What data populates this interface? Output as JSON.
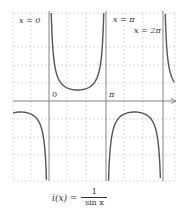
{
  "chart_data": {
    "type": "line",
    "title": "",
    "function": "i(x) = 1 / sin x",
    "xlabel": "",
    "ylabel": "",
    "x_ticks": [
      "0",
      "π"
    ],
    "asymptotes": [
      {
        "label": "x = 0",
        "x": 0
      },
      {
        "label": "x = π",
        "x": 3.14159
      },
      {
        "label": "x = 2π",
        "x": 6.28319
      }
    ],
    "xlim": [
      -1.98,
      6.95
    ],
    "ylim": [
      -7.3,
      8.0
    ],
    "grid": true,
    "grid_style": "dashed",
    "series": [
      {
        "name": "i(x) = 1/sin x",
        "segment": "(-π, 0)",
        "x": [
          -1.98,
          -1.57,
          -1.0,
          -0.5,
          -0.2,
          -0.14
        ],
        "y": [
          -1.09,
          -1.0,
          -1.19,
          -2.09,
          -5.03,
          -7.1
        ]
      },
      {
        "name": "i(x) = 1/sin x",
        "segment": "(0, π)",
        "x": [
          0.12,
          0.2,
          0.5,
          1.0,
          1.57,
          2.14,
          2.64,
          2.94,
          3.02
        ],
        "y": [
          8.36,
          5.03,
          2.09,
          1.19,
          1.0,
          1.19,
          2.09,
          5.03,
          8.36
        ]
      },
      {
        "name": "i(x) = 1/sin x",
        "segment": "(π, 2π)",
        "x": [
          3.28,
          3.64,
          4.14,
          4.71,
          5.28,
          5.78,
          6.14
        ],
        "y": [
          -7.3,
          -2.09,
          -1.19,
          -1.0,
          -1.19,
          -2.09,
          -7.1
        ]
      },
      {
        "name": "i(x) = 1/sin x",
        "segment": "(2π, 3π)",
        "x": [
          6.41,
          6.5,
          6.7,
          6.9
        ],
        "y": [
          7.8,
          4.6,
          2.39,
          1.71
        ]
      }
    ]
  },
  "labels": {
    "asym0": "x = 0",
    "asym_pi": "x = π",
    "asym_2pi": "x = 2π",
    "tick0": "0",
    "tick_pi": "π",
    "formula_lhs": "i(x) =",
    "formula_num": "1",
    "formula_den": "sin x"
  }
}
